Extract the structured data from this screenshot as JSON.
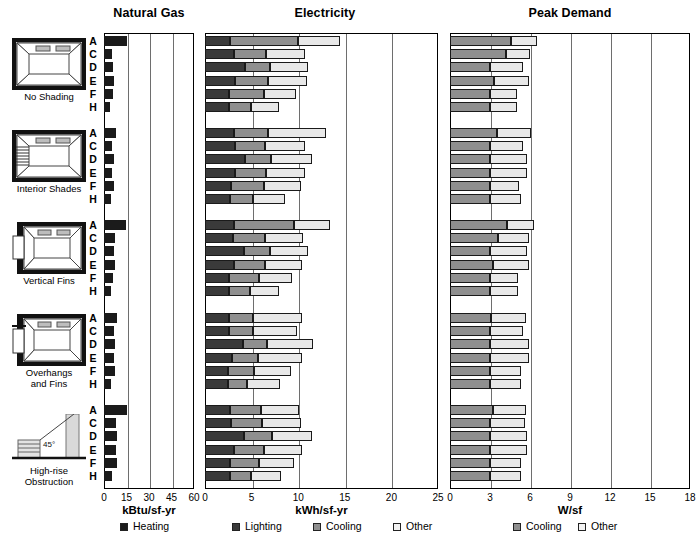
{
  "panels": [
    {
      "title": "Natural Gas",
      "unit": "kBtu/sf-yr",
      "ticks": [
        "0",
        "15",
        "30",
        "45",
        "60"
      ],
      "max": 60,
      "series": [
        "Heating"
      ]
    },
    {
      "title": "Electricity",
      "unit": "kWh/sf-yr",
      "ticks": [
        "0",
        "5",
        "10",
        "15",
        "20",
        "25"
      ],
      "max": 25,
      "series": [
        "Lighting",
        "Cooling",
        "Other"
      ]
    },
    {
      "title": "Peak Demand",
      "unit": "W/sf",
      "ticks": [
        "0",
        "3",
        "6",
        "9",
        "12",
        "15",
        "18"
      ],
      "max": 18,
      "series": [
        "Cooling",
        "Other"
      ]
    }
  ],
  "cases": [
    "A",
    "C",
    "D",
    "E",
    "F",
    "H"
  ],
  "groups": [
    {
      "label_lines": [
        "No Shading"
      ],
      "icon": "no-shading-icon"
    },
    {
      "label_lines": [
        "Interior Shades"
      ],
      "icon": "interior-shades-icon"
    },
    {
      "label_lines": [
        "Vertical Fins"
      ],
      "icon": "vertical-fins-icon"
    },
    {
      "label_lines": [
        "Overhangs",
        "and Fins"
      ],
      "icon": "overhangs-and-fins-icon"
    },
    {
      "label_lines": [
        "High-rise",
        "Obstruction"
      ],
      "icon": "high-rise-obstruction-icon"
    }
  ],
  "icon_annotation": "45°",
  "legend": [
    {
      "name": "Heating",
      "swatch": "sw-heating"
    },
    {
      "name": "Lighting",
      "swatch": "sw-lighting"
    },
    {
      "name": "Cooling",
      "swatch": "sw-cooling"
    },
    {
      "name": "Other",
      "swatch": "sw-other"
    },
    {
      "name": "Cooling",
      "swatch": "sw-cooling"
    },
    {
      "name": "Other",
      "swatch": "sw-other"
    }
  ],
  "colors": {
    "heating": "#1b1b1b",
    "lighting": "#3a3a3a",
    "cooling": "#8f8f8f",
    "other": "#e8e8e8",
    "frame": "#000000",
    "grid": "#6e6e6e"
  },
  "chart_data": {
    "type": "bar",
    "orientation": "horizontal",
    "stacked": true,
    "title": "",
    "grid": true,
    "legend_position": "bottom",
    "group_names": [
      "No Shading",
      "Interior Shades",
      "Vertical Fins",
      "Overhangs and Fins",
      "High-rise Obstruction"
    ],
    "categories": [
      "A",
      "C",
      "D",
      "E",
      "F",
      "H"
    ],
    "panels": [
      {
        "name": "Natural Gas",
        "xlabel": "kBtu/sf-yr",
        "xlim": [
          0,
          60
        ],
        "xticks": [
          0,
          15,
          30,
          45,
          60
        ],
        "series": [
          {
            "name": "Heating",
            "values_by_group": [
              [
                15.0,
                5.5,
                6.0,
                6.5,
                6.0,
                4.0
              ],
              [
                8.0,
                5.0,
                6.5,
                5.0,
                6.5,
                4.5
              ],
              [
                14.5,
                7.0,
                6.5,
                7.0,
                6.0,
                4.5
              ],
              [
                8.5,
                6.5,
                7.0,
                6.5,
                7.0,
                4.5
              ],
              [
                15.5,
                8.0,
                8.5,
                8.0,
                8.5,
                5.5
              ]
            ]
          }
        ]
      },
      {
        "name": "Electricity",
        "xlabel": "kWh/sf-yr",
        "xlim": [
          0,
          25
        ],
        "xticks": [
          0,
          5,
          10,
          15,
          20,
          25
        ],
        "series": [
          {
            "name": "Lighting",
            "values_by_group": [
              [
                2.7,
                3.1,
                4.3,
                3.2,
                2.6,
                2.6
              ],
              [
                3.1,
                3.2,
                4.3,
                3.2,
                2.8,
                2.7
              ],
              [
                3.1,
                3.0,
                4.2,
                3.1,
                2.6,
                2.6
              ],
              [
                2.6,
                2.6,
                4.1,
                2.9,
                2.5,
                2.5
              ],
              [
                2.7,
                2.8,
                4.2,
                3.1,
                2.7,
                2.7
              ]
            ]
          },
          {
            "name": "Cooling",
            "values_by_group": [
              [
                7.3,
                3.4,
                2.7,
                3.6,
                3.7,
                2.3
              ],
              [
                3.7,
                3.2,
                2.8,
                3.3,
                3.5,
                2.4
              ],
              [
                6.5,
                3.4,
                2.8,
                3.3,
                3.2,
                2.2
              ],
              [
                2.5,
                2.6,
                2.5,
                2.8,
                2.8,
                2.0
              ],
              [
                3.3,
                3.3,
                3.0,
                3.2,
                3.1,
                2.2
              ]
            ]
          },
          {
            "name": "Other",
            "values_by_group": [
              [
                4.5,
                4.2,
                4.1,
                4.1,
                3.5,
                3.0
              ],
              [
                6.2,
                4.3,
                4.4,
                4.2,
                4.0,
                3.5
              ],
              [
                3.8,
                4.1,
                4.1,
                4.0,
                3.5,
                3.1
              ],
              [
                5.3,
                4.7,
                5.0,
                4.7,
                3.9,
                3.5
              ],
              [
                4.1,
                4.2,
                4.3,
                4.1,
                3.7,
                3.3
              ]
            ]
          }
        ]
      },
      {
        "name": "Peak Demand",
        "xlabel": "W/sf",
        "xlim": [
          0,
          18
        ],
        "xticks": [
          0,
          3,
          6,
          9,
          12,
          15,
          18
        ],
        "series": [
          {
            "name": "Cooling",
            "values_by_group": [
              [
                4.6,
                4.2,
                3.0,
                3.3,
                3.0,
                3.0
              ],
              [
                3.5,
                3.0,
                3.0,
                3.0,
                3.0,
                3.0
              ],
              [
                4.3,
                3.6,
                3.0,
                3.2,
                3.0,
                3.0
              ],
              [
                3.1,
                3.0,
                3.0,
                3.0,
                3.0,
                3.0
              ],
              [
                3.2,
                3.0,
                3.0,
                3.0,
                3.0,
                3.0
              ]
            ]
          },
          {
            "name": "Other",
            "values_by_group": [
              [
                1.9,
                1.8,
                2.5,
                2.6,
                2.0,
                2.0
              ],
              [
                2.6,
                2.5,
                2.8,
                2.8,
                2.2,
                2.3
              ],
              [
                2.0,
                2.3,
                2.8,
                2.7,
                2.1,
                2.1
              ],
              [
                2.6,
                2.5,
                2.9,
                2.9,
                2.3,
                2.3
              ],
              [
                2.5,
                2.6,
                2.8,
                2.8,
                2.3,
                2.3
              ]
            ]
          }
        ]
      }
    ]
  }
}
